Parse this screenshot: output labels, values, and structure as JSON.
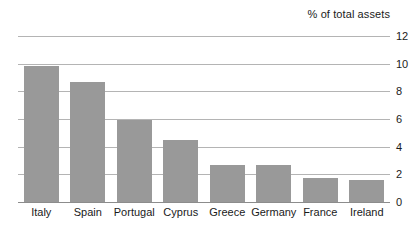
{
  "chart_data": {
    "type": "bar",
    "title": "% of total assets",
    "xlabel": "",
    "ylabel": "% of total assets",
    "ylim": [
      0,
      12
    ],
    "yticks": [
      0,
      2,
      4,
      6,
      8,
      10,
      12
    ],
    "ytick_labels": [
      "0",
      "2",
      "4",
      "6",
      "8",
      "10",
      "12"
    ],
    "grid": true,
    "legend": false,
    "y_axis_position": "right",
    "categories": [
      "Italy",
      "Spain",
      "Portugal",
      "Cyprus",
      "Greece",
      "Germany",
      "France",
      "Ireland"
    ],
    "values": [
      9.8,
      8.7,
      5.9,
      4.5,
      2.7,
      2.7,
      1.7,
      1.6
    ],
    "series": [
      {
        "name": "% of total assets",
        "values": [
          9.8,
          8.7,
          5.9,
          4.5,
          2.7,
          2.7,
          1.7,
          1.6
        ],
        "color": "#999999"
      }
    ]
  },
  "style": {
    "bar_color": "#999999",
    "gridline_color": "#b4b4b4",
    "baseline_color": "#8c8c8c",
    "text_color": "#1a1a1a",
    "background": "#ffffff"
  }
}
